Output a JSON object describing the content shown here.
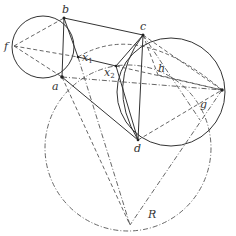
{
  "diagram": {
    "type": "geometry-construction",
    "labels": {
      "f": "f",
      "b": "b",
      "a": "a",
      "x1": "x",
      "x1_sub": "1",
      "x2": "x",
      "x2_sub": "2",
      "c": "c",
      "h": "h",
      "d": "d",
      "g": "g",
      "R": "R"
    },
    "colors": {
      "stroke": "#333333",
      "construction": "#555555",
      "background": "#ffffff"
    }
  }
}
